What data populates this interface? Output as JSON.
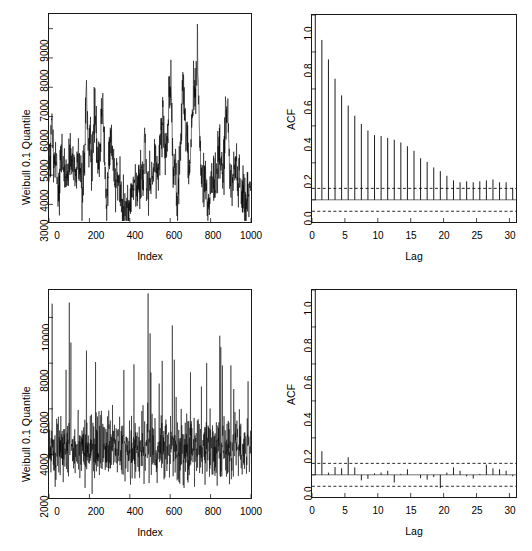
{
  "figure": {
    "layout": "2x2 panel grid",
    "background": "#ffffff",
    "line_color": "#000000"
  },
  "panels": {
    "top_left": {
      "name": "Time series of Weibull 0.1 Quantile (dependent / block bootstrap)"
    },
    "top_right": {
      "name": "ACF of dependent Weibull 0.1 Quantile series"
    },
    "bottom_left": {
      "name": "Time series of Weibull 0.1 Quantile (iid bootstrap)"
    },
    "bottom_right": {
      "name": "ACF of iid Weibull 0.1 Quantile series"
    }
  },
  "chart_data": [
    {
      "id": "series-dependent",
      "type": "line",
      "title": "",
      "xlabel": "Index",
      "ylabel": "Weibull 0.1 Quantile",
      "xlim": [
        0,
        1000
      ],
      "ylim": [
        2400,
        9500
      ],
      "xticks": [
        0,
        200,
        400,
        600,
        800,
        1000
      ],
      "yticks": [
        3000,
        4000,
        5000,
        6000,
        7000,
        8000,
        9000
      ],
      "xticklabels": [
        "0",
        "200",
        "400",
        "600",
        "800",
        "1000"
      ],
      "yticklabels": [
        "3000",
        "4000",
        "5000",
        "6000",
        "7000",
        "8000",
        "9000"
      ],
      "grid": false,
      "legend": null,
      "n_points": 1000,
      "description": "Slowly drifting autocorrelated series; mean wanders between ~3000 and ~5500 with spikes to 9300",
      "x": [
        5,
        15,
        25,
        35,
        45,
        55,
        65,
        75,
        85,
        95,
        105,
        115,
        125,
        135,
        145,
        155,
        165,
        175,
        185,
        195,
        205,
        215,
        225,
        235,
        245,
        255,
        265,
        275,
        285,
        295,
        305,
        315,
        325,
        335,
        345,
        355,
        365,
        375,
        385,
        395,
        405,
        415,
        425,
        435,
        445,
        455,
        465,
        475,
        485,
        495,
        505,
        515,
        525,
        535,
        545,
        555,
        565,
        575,
        585,
        595,
        605,
        615,
        625,
        635,
        645,
        655,
        665,
        675,
        685,
        695,
        705,
        715,
        725,
        735,
        745,
        755,
        765,
        775,
        785,
        795,
        805,
        815,
        825,
        835,
        845,
        855,
        865,
        875,
        885,
        895,
        905,
        915,
        925,
        935,
        945,
        955,
        965,
        975,
        985,
        995
      ],
      "values": [
        4150,
        6000,
        3850,
        4400,
        3000,
        4350,
        4750,
        4050,
        4150,
        3950,
        4900,
        4250,
        4350,
        4000,
        4500,
        4200,
        3950,
        4350,
        7250,
        4700,
        5250,
        4100,
        5950,
        5050,
        4350,
        5200,
        6400,
        4750,
        2500,
        4600,
        5100,
        4900,
        3700,
        4350,
        3600,
        3500,
        3050,
        2850,
        2800,
        2900,
        3100,
        3650,
        3800,
        3550,
        3850,
        3750,
        4000,
        5300,
        3650,
        3950,
        3400,
        4300,
        4800,
        4250,
        4550,
        5450,
        6000,
        4450,
        5000,
        6800,
        6750,
        4100,
        4400,
        2800,
        4350,
        5450,
        7250,
        5700,
        4950,
        3750,
        5400,
        7100,
        6750,
        8450,
        5150,
        3950,
        3650,
        4200,
        2800,
        3050,
        4000,
        3350,
        3600,
        4100,
        4900,
        4300,
        4350,
        6200,
        6450,
        4200,
        3700,
        4050,
        4300,
        3500,
        3900,
        3150,
        3550,
        2700,
        3250,
        3800
      ]
    },
    {
      "id": "acf-dependent",
      "type": "bar",
      "title": "",
      "xlabel": "Lag",
      "ylabel": "ACF",
      "xlim": [
        0,
        31
      ],
      "ylim": [
        -0.12,
        1.0
      ],
      "xticks": [
        0,
        5,
        10,
        15,
        20,
        25,
        30
      ],
      "yticks": [
        0.0,
        0.2,
        0.4,
        0.6,
        0.8,
        1.0
      ],
      "xticklabels": [
        "0",
        "5",
        "10",
        "15",
        "20",
        "25",
        "30"
      ],
      "yticklabels": [
        "0.0",
        "0.2",
        "0.4",
        "0.6",
        "0.8",
        "1.0"
      ],
      "grid": false,
      "legend": null,
      "conf_level": 0.062,
      "description": "Slowly decaying ACF indicating strong positive serial dependence out to lag ~20",
      "lags": [
        0,
        1,
        2,
        3,
        4,
        5,
        6,
        7,
        8,
        9,
        10,
        11,
        12,
        13,
        14,
        15,
        16,
        17,
        18,
        19,
        20,
        21,
        22,
        23,
        24,
        25,
        26,
        27,
        28,
        29,
        30
      ],
      "values": [
        1.0,
        0.865,
        0.76,
        0.655,
        0.565,
        0.51,
        0.455,
        0.41,
        0.375,
        0.35,
        0.345,
        0.335,
        0.325,
        0.31,
        0.29,
        0.265,
        0.225,
        0.205,
        0.175,
        0.155,
        0.13,
        0.105,
        0.095,
        0.1,
        0.095,
        0.1,
        0.105,
        0.11,
        0.095,
        0.095,
        0.065
      ]
    },
    {
      "id": "series-iid",
      "type": "line",
      "title": "",
      "xlabel": "Index",
      "ylabel": "Weibull 0.1 Quantile",
      "xlim": [
        0,
        1000
      ],
      "ylim": [
        2100,
        11200
      ],
      "xticks": [
        0,
        200,
        400,
        600,
        800,
        1000
      ],
      "yticks": [
        2000,
        4000,
        6000,
        8000,
        10000
      ],
      "xticklabels": [
        "0",
        "200",
        "400",
        "600",
        "800",
        "1000"
      ],
      "yticklabels": [
        "2000",
        "4000",
        "6000",
        "8000",
        "10000"
      ],
      "grid": false,
      "legend": false,
      "n_points": 1000,
      "description": "High-frequency noise centred near 4300 with occasional spikes to ~11000; no visible drift",
      "center": 4300,
      "noise_sd": 700,
      "spikes": [
        {
          "index": 15,
          "value": 10600
        },
        {
          "index": 100,
          "value": 10650
        },
        {
          "index": 108,
          "value": 8900
        },
        {
          "index": 185,
          "value": 8550
        },
        {
          "index": 230,
          "value": 8050
        },
        {
          "index": 370,
          "value": 7700
        },
        {
          "index": 420,
          "value": 7950
        },
        {
          "index": 490,
          "value": 11050
        },
        {
          "index": 500,
          "value": 9300
        },
        {
          "index": 560,
          "value": 8100
        },
        {
          "index": 610,
          "value": 9650
        },
        {
          "index": 620,
          "value": 8150
        },
        {
          "index": 700,
          "value": 7600
        },
        {
          "index": 780,
          "value": 8000
        },
        {
          "index": 845,
          "value": 9200
        },
        {
          "index": 850,
          "value": 8700
        },
        {
          "index": 900,
          "value": 7900
        }
      ]
    },
    {
      "id": "acf-iid",
      "type": "bar",
      "title": "",
      "xlabel": "Lag",
      "ylabel": "ACF",
      "xlim": [
        0,
        31
      ],
      "ylim": [
        -0.12,
        1.0
      ],
      "xticks": [
        0,
        5,
        10,
        15,
        20,
        25,
        30
      ],
      "yticks": [
        0.0,
        0.2,
        0.4,
        0.6,
        0.8,
        1.0
      ],
      "xticklabels": [
        "0",
        "5",
        "10",
        "15",
        "20",
        "25",
        "30"
      ],
      "yticklabels": [
        "0.0",
        "0.2",
        "0.4",
        "0.6",
        "0.8",
        "1.0"
      ],
      "grid": false,
      "legend": null,
      "conf_level": 0.062,
      "description": "Essentially white noise: only lag 0 is 1.0, all other lags lie near zero within the confidence bands",
      "lags": [
        0,
        1,
        2,
        3,
        4,
        5,
        6,
        7,
        8,
        9,
        10,
        11,
        12,
        13,
        14,
        15,
        16,
        17,
        18,
        19,
        20,
        21,
        22,
        23,
        24,
        25,
        26,
        27,
        28,
        29,
        30
      ],
      "values": [
        1.0,
        0.128,
        0.012,
        0.042,
        0.035,
        0.095,
        0.04,
        -0.03,
        -0.022,
        0.008,
        0.012,
        0.022,
        -0.042,
        0.005,
        0.03,
        0.0,
        -0.018,
        -0.026,
        -0.012,
        -0.072,
        0.012,
        0.04,
        0.022,
        -0.008,
        -0.02,
        0.005,
        0.055,
        0.035,
        0.03,
        0.022,
        -0.008
      ]
    }
  ]
}
